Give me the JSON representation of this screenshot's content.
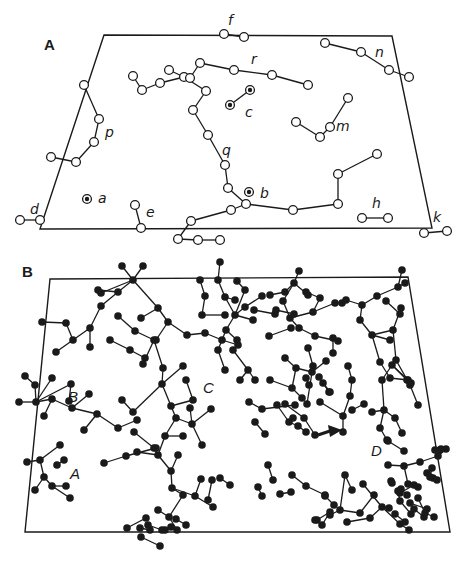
{
  "figure": {
    "panels": [
      {
        "id": "A",
        "label": "A",
        "node_style": "open-circle",
        "cluster_labels": [
          "f",
          "n",
          "r",
          "c",
          "m",
          "p",
          "q",
          "a",
          "b",
          "d",
          "e",
          "h",
          "k"
        ],
        "isolated_targets": [
          "a",
          "b"
        ],
        "paired_targets": [
          "c"
        ]
      },
      {
        "id": "B",
        "label": "B",
        "node_style": "filled-dot",
        "region_labels": [
          "A",
          "B",
          "C",
          "D"
        ],
        "annotation": "arrow pointing to node near D"
      }
    ]
  }
}
